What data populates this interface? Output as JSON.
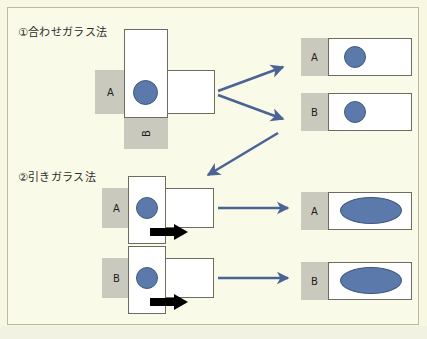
{
  "figure": {
    "background_color": "#fafae8",
    "border_color": "#b9b9a6",
    "caption": "",
    "accent_blue": "#5b79ab",
    "arrow_blue": "#4a6496",
    "frosted_gray": "#c9c9bd",
    "slide_outline": "#6d6d5f"
  },
  "sections": [
    {
      "id": "section-1",
      "title": "①合わせガラス法",
      "left_labels": {
        "horizontal_slide": "A",
        "vertical_slide": "B"
      },
      "results": [
        {
          "label": "A",
          "shape": "circle"
        },
        {
          "label": "B",
          "shape": "circle"
        }
      ]
    },
    {
      "id": "section-2",
      "title": "②引きガラス法",
      "steps": [
        {
          "label": "A",
          "shape": "circle",
          "push": true
        },
        {
          "label": "B",
          "shape": "circle",
          "push": true
        }
      ],
      "results": [
        {
          "label": "A",
          "shape": "ellipse"
        },
        {
          "label": "B",
          "shape": "ellipse"
        }
      ]
    }
  ],
  "arrows": {
    "branch_top": "arrow-to-result-a",
    "branch_bottom": "arrow-to-result-b",
    "diagonal": "arrow-to-section-2",
    "step_a": "arrow-to-smear-a",
    "step_b": "arrow-to-smear-b",
    "push_a": "push-direction-a",
    "push_b": "push-direction-b"
  }
}
